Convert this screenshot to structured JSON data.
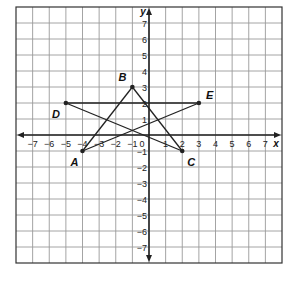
{
  "chart_data": {
    "type": "scatter",
    "title": "",
    "xlabel": "x",
    "ylabel": "y",
    "xlim": [
      -8,
      8
    ],
    "ylim": [
      -8,
      8
    ],
    "grid": true,
    "x_ticks": [
      -7,
      -6,
      -5,
      -4,
      -3,
      -2,
      -1,
      0,
      1,
      2,
      3,
      4,
      5,
      6,
      7
    ],
    "y_ticks": [
      -7,
      -6,
      -5,
      -4,
      -3,
      -2,
      -1,
      1,
      2,
      3,
      4,
      5,
      6,
      7
    ],
    "points": [
      {
        "label": "A",
        "x": -4,
        "y": -1
      },
      {
        "label": "B",
        "x": -1,
        "y": 3
      },
      {
        "label": "C",
        "x": 2,
        "y": -1
      },
      {
        "label": "D",
        "x": -5,
        "y": 2
      },
      {
        "label": "E",
        "x": 3,
        "y": 2
      }
    ],
    "segments": [
      [
        "A",
        "B"
      ],
      [
        "B",
        "C"
      ],
      [
        "C",
        "D"
      ],
      [
        "D",
        "E"
      ],
      [
        "E",
        "A"
      ]
    ]
  },
  "style": {
    "grid_color": "#9a9a9a",
    "axis_color": "#222222",
    "line_color": "#222222"
  },
  "label_offsets": {
    "A": [
      -12,
      15
    ],
    "B": [
      -14,
      -6
    ],
    "C": [
      5,
      15
    ],
    "D": [
      -14,
      15
    ],
    "E": [
      7,
      -4
    ]
  }
}
